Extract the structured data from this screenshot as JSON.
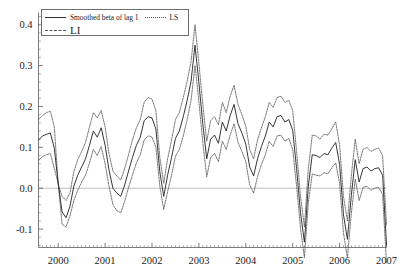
{
  "chart_data": {
    "type": "line",
    "title": "",
    "xlabel": "",
    "ylabel": "",
    "xlim": [
      1999.58,
      2007.0
    ],
    "ylim": [
      -0.145,
      0.425
    ],
    "grid": false,
    "legend_position": "top-left",
    "y_ticks": [
      "0.4",
      "0.3",
      "0.2",
      "0.1",
      "0.0",
      "-0.1"
    ],
    "y_tick_values": [
      0.4,
      0.3,
      0.2,
      0.1,
      0.0,
      -0.1
    ],
    "x_ticks": [
      "2000",
      "2001",
      "2002",
      "2003",
      "2004",
      "2005",
      "2006",
      "2007"
    ],
    "x_tick_values": [
      2000,
      2001,
      2002,
      2003,
      2004,
      2005,
      2006,
      2007
    ],
    "zero_reference_line": 0.0,
    "colors": {
      "smoothed_beta": "#2b2b2b",
      "ls": "#555555",
      "li": "#555555",
      "axis": "#5a5a5a",
      "zero_line": "#b9b9b9"
    },
    "x": [
      1999.583,
      1999.667,
      1999.75,
      1999.833,
      1999.917,
      2000.0,
      2000.083,
      2000.167,
      2000.25,
      2000.333,
      2000.417,
      2000.5,
      2000.583,
      2000.667,
      2000.75,
      2000.833,
      2000.917,
      2001.0,
      2001.083,
      2001.167,
      2001.25,
      2001.333,
      2001.417,
      2001.5,
      2001.583,
      2001.667,
      2001.75,
      2001.833,
      2001.917,
      2002.0,
      2002.083,
      2002.167,
      2002.25,
      2002.333,
      2002.417,
      2002.5,
      2002.583,
      2002.667,
      2002.75,
      2002.833,
      2002.917,
      2003.0,
      2003.083,
      2003.167,
      2003.25,
      2003.333,
      2003.417,
      2003.5,
      2003.583,
      2003.667,
      2003.75,
      2003.833,
      2003.917,
      2004.0,
      2004.083,
      2004.167,
      2004.25,
      2004.333,
      2004.417,
      2004.5,
      2004.583,
      2004.667,
      2004.75,
      2004.833,
      2004.917,
      2005.0,
      2005.083,
      2005.167,
      2005.25,
      2005.333,
      2005.417,
      2005.5,
      2005.583,
      2005.667,
      2005.75,
      2005.833,
      2005.917,
      2006.0,
      2006.083,
      2006.167,
      2006.25,
      2006.333,
      2006.417,
      2006.5,
      2006.583,
      2006.667,
      2006.75,
      2006.833,
      2006.917,
      2007.0
    ],
    "series": [
      {
        "name": "LS",
        "style": "dotted",
        "role": "upper-band",
        "values": [
          0.168,
          0.178,
          0.185,
          0.188,
          0.15,
          0.01,
          -0.02,
          -0.03,
          -0.012,
          0.04,
          0.07,
          0.09,
          0.112,
          0.15,
          0.185,
          0.172,
          0.19,
          0.15,
          0.085,
          0.042,
          0.03,
          0.02,
          0.048,
          0.082,
          0.118,
          0.148,
          0.168,
          0.21,
          0.222,
          0.218,
          0.19,
          0.075,
          0.012,
          0.072,
          0.118,
          0.168,
          0.185,
          0.222,
          0.262,
          0.31,
          0.4,
          0.305,
          0.205,
          0.115,
          0.165,
          0.175,
          0.155,
          0.21,
          0.185,
          0.225,
          0.252,
          0.205,
          0.18,
          0.152,
          0.095,
          0.072,
          0.118,
          0.148,
          0.175,
          0.21,
          0.198,
          0.222,
          0.225,
          0.21,
          0.215,
          0.19,
          0.09,
          -0.02,
          -0.095,
          0.048,
          0.13,
          0.128,
          0.12,
          0.132,
          0.13,
          0.145,
          0.162,
          0.105,
          -0.02,
          -0.08,
          0.03,
          0.12,
          0.06,
          0.095,
          0.1,
          0.09,
          0.095,
          0.098,
          0.08,
          -0.09
        ]
      },
      {
        "name": "Smoothed beta of lag 1",
        "style": "solid",
        "role": "center",
        "values": [
          0.118,
          0.128,
          0.132,
          0.135,
          0.098,
          0.012,
          -0.058,
          -0.072,
          -0.045,
          0.005,
          0.032,
          0.052,
          0.072,
          0.105,
          0.14,
          0.125,
          0.148,
          0.105,
          0.045,
          0.0,
          -0.012,
          -0.02,
          0.008,
          0.042,
          0.075,
          0.105,
          0.125,
          0.165,
          0.175,
          0.172,
          0.145,
          0.04,
          -0.02,
          0.032,
          0.075,
          0.122,
          0.14,
          0.175,
          0.215,
          0.262,
          0.35,
          0.258,
          0.158,
          0.072,
          0.12,
          0.13,
          0.11,
          0.162,
          0.14,
          0.178,
          0.205,
          0.158,
          0.135,
          0.108,
          0.052,
          0.03,
          0.072,
          0.102,
          0.128,
          0.162,
          0.15,
          0.175,
          0.178,
          0.162,
          0.168,
          0.142,
          0.048,
          -0.06,
          -0.132,
          0.005,
          0.082,
          0.08,
          0.075,
          0.085,
          0.082,
          0.098,
          0.112,
          0.058,
          -0.065,
          -0.125,
          -0.018,
          0.07,
          0.015,
          0.048,
          0.052,
          0.042,
          0.048,
          0.05,
          0.032,
          -0.138
        ]
      },
      {
        "name": "LI",
        "style": "dash-dot",
        "role": "lower-band",
        "values": [
          0.068,
          0.078,
          0.082,
          0.085,
          0.048,
          0.012,
          -0.088,
          -0.095,
          -0.068,
          -0.03,
          -0.005,
          0.015,
          0.032,
          0.062,
          0.095,
          0.08,
          0.102,
          0.06,
          0.005,
          -0.04,
          -0.055,
          -0.06,
          -0.032,
          0.002,
          0.032,
          0.062,
          0.082,
          0.118,
          0.128,
          0.125,
          0.1,
          0.005,
          -0.052,
          -0.008,
          0.032,
          0.078,
          0.095,
          0.128,
          0.168,
          0.215,
          0.3,
          0.212,
          0.112,
          0.028,
          0.075,
          0.085,
          0.065,
          0.115,
          0.095,
          0.13,
          0.158,
          0.112,
          0.09,
          0.065,
          0.008,
          -0.012,
          0.028,
          0.058,
          0.082,
          0.115,
          0.102,
          0.128,
          0.13,
          0.115,
          0.122,
          0.095,
          0.005,
          -0.098,
          -0.17,
          -0.035,
          0.035,
          0.032,
          0.03,
          0.038,
          0.035,
          0.05,
          0.062,
          0.012,
          -0.11,
          -0.17,
          -0.062,
          0.022,
          -0.03,
          0.002,
          0.005,
          -0.005,
          0.0,
          0.002,
          -0.015,
          -0.185
        ]
      }
    ]
  },
  "legend": {
    "entries": [
      {
        "label": "Smoothed beta of lag 1",
        "style": "solid"
      },
      {
        "label": "LS",
        "style": "dotted"
      },
      {
        "label": "LI",
        "style": "dash-dot"
      }
    ],
    "smoothed_label": "Smoothed beta of lag 1",
    "ls_label": "LS",
    "li_label": "LI"
  }
}
